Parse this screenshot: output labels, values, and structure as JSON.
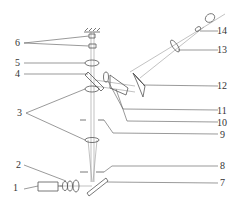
{
  "diagram": {
    "type": "optical-setup-schematic",
    "colors": {
      "stroke": "#555555",
      "beam": "#999999",
      "text": "#333333"
    },
    "labels": [
      {
        "id": "1",
        "text": "1"
      },
      {
        "id": "2",
        "text": "2"
      },
      {
        "id": "3",
        "text": "3"
      },
      {
        "id": "4",
        "text": "4"
      },
      {
        "id": "5",
        "text": "5"
      },
      {
        "id": "6",
        "text": "6"
      },
      {
        "id": "7",
        "text": "7"
      },
      {
        "id": "8",
        "text": "8"
      },
      {
        "id": "9",
        "text": "9"
      },
      {
        "id": "10",
        "text": "10"
      },
      {
        "id": "11",
        "text": "11"
      },
      {
        "id": "12",
        "text": "12"
      },
      {
        "id": "13",
        "text": "13"
      },
      {
        "id": "14",
        "text": "14"
      }
    ]
  }
}
